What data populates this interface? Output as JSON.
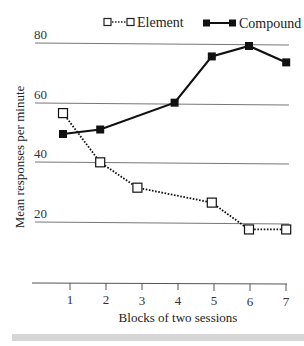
{
  "chart_data": {
    "type": "line",
    "title": "",
    "xlabel": "Blocks of two sessions",
    "ylabel": "Mean responses per minute",
    "x": [
      1,
      2,
      3,
      4,
      5,
      6,
      7
    ],
    "xticks": [
      "1",
      "2",
      "3",
      "4",
      "5",
      "6",
      "7"
    ],
    "yticks": [
      "20",
      "40",
      "60",
      "80"
    ],
    "ylim": [
      0,
      80
    ],
    "grid": "horizontal at 20, 40, 60, 80",
    "legend_position": "top",
    "series": [
      {
        "name": "Element",
        "style": "dotted line, open square markers",
        "x": [
          1,
          2,
          3,
          5,
          6,
          7
        ],
        "values": [
          56.5,
          40,
          31.5,
          26.5,
          17.5,
          17.5
        ]
      },
      {
        "name": "Compound",
        "style": "solid line, filled square markers",
        "x": [
          1,
          2,
          4,
          5,
          6,
          7
        ],
        "values": [
          49.5,
          51,
          60,
          75.5,
          79,
          73.5
        ]
      }
    ]
  },
  "legend": {
    "element_label": "Element",
    "compound_label": "Compound"
  },
  "axes": {
    "xlabel": "Blocks of two sessions",
    "ylabel": "Mean responses per minute",
    "yticks": {
      "t80": "80",
      "t60": "60",
      "t40": "40",
      "t20": "20"
    },
    "xticks": {
      "t1": "1",
      "t2": "2",
      "t3": "3",
      "t4": "4",
      "t5": "5",
      "t6": "6",
      "t7": "7"
    }
  },
  "colors": {
    "line": "#111111",
    "grid": "#777777",
    "strip": "#d6d6d6"
  }
}
